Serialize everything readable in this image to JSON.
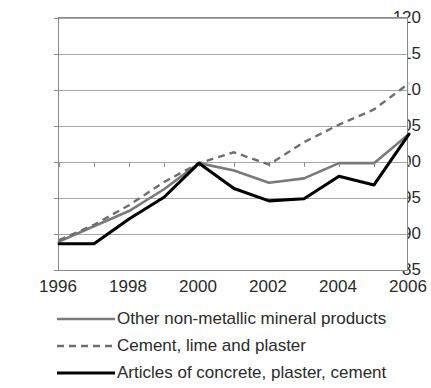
{
  "chart_data": {
    "type": "line",
    "title": "",
    "xlabel": "",
    "ylabel": "",
    "x": [
      1996,
      1997,
      1998,
      1999,
      2000,
      2001,
      2002,
      2003,
      2004,
      2005,
      2006
    ],
    "xlim": [
      1996,
      2006
    ],
    "ylim": [
      85,
      120
    ],
    "ytick_labels": [
      "120",
      "115",
      "110",
      "105",
      "100",
      "95",
      "90",
      "85"
    ],
    "yticks": [
      120,
      115,
      110,
      105,
      100,
      95,
      90,
      85
    ],
    "xtick_labels": [
      "1996",
      "1998",
      "2000",
      "2002",
      "2004",
      "2006"
    ],
    "xticks": [
      1996,
      1998,
      2000,
      2002,
      2004,
      2006
    ],
    "grid": true,
    "grid_axis": "y",
    "legend_position": "below",
    "series": [
      {
        "name": "Other non-metallic mineral products",
        "style": "solid",
        "color": "#7a7a7a",
        "values": [
          89.2,
          91.3,
          93.4,
          96.4,
          100.0,
          99.0,
          97.3,
          97.9,
          100.0,
          100.0,
          104.0
        ]
      },
      {
        "name": "Cement, lime and plaster",
        "style": "dashed",
        "color": "#6f6f6f",
        "values": [
          89.4,
          91.5,
          94.2,
          97.4,
          100.0,
          101.5,
          99.8,
          102.9,
          105.3,
          107.4,
          111.0
        ]
      },
      {
        "name": "Articles of concrete, plaster, cement",
        "style": "solid",
        "color": "#000000",
        "values": [
          88.9,
          88.9,
          92.3,
          95.3,
          100.0,
          96.5,
          94.8,
          95.1,
          98.2,
          97.0,
          104.0
        ]
      }
    ]
  }
}
